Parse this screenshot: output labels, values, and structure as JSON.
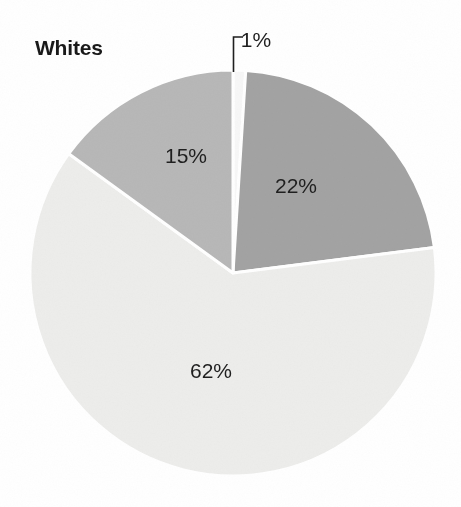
{
  "figure": {
    "width": 461,
    "height": 507,
    "background": "#ffffff"
  },
  "title": {
    "text": "Whites",
    "color": "#1a1a1a"
  },
  "leader": {
    "name": "callout-leader-line",
    "color": "#1f1f1f"
  },
  "chart_data": {
    "type": "pie",
    "title": "Whites",
    "subtitle": "",
    "xlabel": "",
    "ylabel": "",
    "units": "percent",
    "legend": "none",
    "grid": false,
    "start_angle_deg": 0,
    "direction": "clockwise",
    "center": [
      233,
      273
    ],
    "radius": 203,
    "labels": [
      "1%",
      "22%",
      "62%",
      "15%"
    ],
    "values": [
      1,
      22,
      62,
      15
    ],
    "colors": [
      "#f7f7f7",
      "#a3a3a3",
      "#ededeb",
      "#b8b8b8"
    ],
    "slices": [
      {
        "label": "1%",
        "value": 1,
        "color": "#f7f7f7",
        "start_deg": 0,
        "end_deg": 3.6,
        "label_x": 256,
        "label_y": 40,
        "label_color": "#1f1f1f",
        "callout": true
      },
      {
        "label": "22%",
        "value": 22,
        "color": "#a3a3a3",
        "start_deg": 3.6,
        "end_deg": 82.8,
        "label_x": 296,
        "label_y": 186,
        "label_color": "#1f1f1f",
        "callout": false
      },
      {
        "label": "62%",
        "value": 62,
        "color": "#ededeb",
        "start_deg": 82.8,
        "end_deg": 306.0,
        "label_x": 211,
        "label_y": 371,
        "label_color": "#1f1f1f",
        "callout": false
      },
      {
        "label": "15%",
        "value": 15,
        "color": "#b8b8b8",
        "start_deg": 306.0,
        "end_deg": 360.0,
        "label_x": 186,
        "label_y": 156,
        "label_color": "#1f1f1f",
        "callout": false
      }
    ],
    "separator_color": "#ffffff",
    "separator_width": 3
  }
}
